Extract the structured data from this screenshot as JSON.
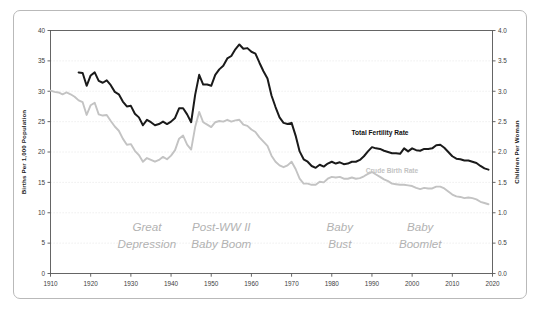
{
  "chart_data": {
    "type": "line",
    "title": "",
    "xlabel": "",
    "ylabel": "Births Per 1,000 Population",
    "y2label": "Children Per Woman",
    "xlim": [
      1910,
      2020
    ],
    "ylim": [
      0,
      40
    ],
    "y2lim": [
      0.0,
      4.0
    ],
    "grid": true,
    "legend_position": "inline-annotation",
    "x_ticks": [
      "1910",
      "1920",
      "1930",
      "1940",
      "1950",
      "1960",
      "1970",
      "1980",
      "1990",
      "2000",
      "2010",
      "2020"
    ],
    "y_ticks": [
      "0",
      "5",
      "10",
      "15",
      "20",
      "25",
      "30",
      "35",
      "40"
    ],
    "y2_ticks": [
      "0.0",
      "0.5",
      "1.0",
      "1.5",
      "2.0",
      "2.5",
      "3.0",
      "3.5",
      "4.0"
    ],
    "series": [
      {
        "name": "Total Fertility Rate",
        "axis": "right",
        "color": "#1a1a1a",
        "label_x": 1992,
        "label_y": 2.28,
        "x": [
          1917,
          1918,
          1919,
          1920,
          1921,
          1922,
          1923,
          1924,
          1925,
          1926,
          1927,
          1928,
          1929,
          1930,
          1931,
          1932,
          1933,
          1934,
          1935,
          1936,
          1937,
          1938,
          1939,
          1940,
          1941,
          1942,
          1943,
          1944,
          1945,
          1946,
          1947,
          1948,
          1949,
          1950,
          1951,
          1952,
          1953,
          1954,
          1955,
          1956,
          1957,
          1958,
          1959,
          1960,
          1961,
          1962,
          1963,
          1964,
          1965,
          1966,
          1967,
          1968,
          1969,
          1970,
          1971,
          1972,
          1973,
          1974,
          1975,
          1976,
          1977,
          1978,
          1979,
          1980,
          1981,
          1982,
          1983,
          1984,
          1985,
          1986,
          1987,
          1988,
          1989,
          1990,
          1991,
          1992,
          1993,
          1994,
          1995,
          1996,
          1997,
          1998,
          1999,
          2000,
          2001,
          2002,
          2003,
          2004,
          2005,
          2006,
          2007,
          2008,
          2009,
          2010,
          2011,
          2012,
          2013,
          2014,
          2015,
          2016,
          2017,
          2018,
          2019
        ],
        "y": [
          3.31,
          3.3,
          3.09,
          3.26,
          3.31,
          3.17,
          3.14,
          3.18,
          3.1,
          2.99,
          2.95,
          2.83,
          2.75,
          2.76,
          2.63,
          2.57,
          2.44,
          2.53,
          2.49,
          2.44,
          2.46,
          2.5,
          2.46,
          2.5,
          2.56,
          2.72,
          2.72,
          2.62,
          2.49,
          2.94,
          3.27,
          3.11,
          3.11,
          3.09,
          3.27,
          3.36,
          3.42,
          3.54,
          3.58,
          3.69,
          3.77,
          3.7,
          3.71,
          3.65,
          3.62,
          3.47,
          3.33,
          3.21,
          2.93,
          2.74,
          2.57,
          2.48,
          2.46,
          2.48,
          2.27,
          2.01,
          1.88,
          1.84,
          1.77,
          1.74,
          1.79,
          1.76,
          1.81,
          1.84,
          1.81,
          1.83,
          1.8,
          1.81,
          1.84,
          1.84,
          1.87,
          1.93,
          2.01,
          2.08,
          2.06,
          2.05,
          2.02,
          2.0,
          1.98,
          1.98,
          1.97,
          2.06,
          2.01,
          2.06,
          2.03,
          2.02,
          2.05,
          2.05,
          2.06,
          2.11,
          2.12,
          2.07,
          2.0,
          1.93,
          1.89,
          1.88,
          1.86,
          1.86,
          1.84,
          1.82,
          1.77,
          1.73,
          1.71
        ]
      },
      {
        "name": "Crude Birth Rate",
        "axis": "left",
        "color": "#c3c3c3",
        "label_x": 1995,
        "label_y": 16.6,
        "x": [
          1910,
          1911,
          1912,
          1913,
          1914,
          1915,
          1916,
          1917,
          1918,
          1919,
          1920,
          1921,
          1922,
          1923,
          1924,
          1925,
          1926,
          1927,
          1928,
          1929,
          1930,
          1931,
          1932,
          1933,
          1934,
          1935,
          1936,
          1937,
          1938,
          1939,
          1940,
          1941,
          1942,
          1943,
          1944,
          1945,
          1946,
          1947,
          1948,
          1949,
          1950,
          1951,
          1952,
          1953,
          1954,
          1955,
          1956,
          1957,
          1958,
          1959,
          1960,
          1961,
          1962,
          1963,
          1964,
          1965,
          1966,
          1967,
          1968,
          1969,
          1970,
          1971,
          1972,
          1973,
          1974,
          1975,
          1976,
          1977,
          1978,
          1979,
          1980,
          1981,
          1982,
          1983,
          1984,
          1985,
          1986,
          1987,
          1988,
          1989,
          1990,
          1991,
          1992,
          1993,
          1994,
          1995,
          1996,
          1997,
          1998,
          1999,
          2000,
          2001,
          2002,
          2003,
          2004,
          2005,
          2006,
          2007,
          2008,
          2009,
          2010,
          2011,
          2012,
          2013,
          2014,
          2015,
          2016,
          2017,
          2018,
          2019
        ],
        "y": [
          30.1,
          29.9,
          29.8,
          29.5,
          29.8,
          29.5,
          29.1,
          28.5,
          28.2,
          26.1,
          27.7,
          28.1,
          26.2,
          26.0,
          26.1,
          25.1,
          24.2,
          23.5,
          22.2,
          21.2,
          21.3,
          20.2,
          19.5,
          18.4,
          19.0,
          18.7,
          18.4,
          18.7,
          19.2,
          18.8,
          19.4,
          20.3,
          22.2,
          22.7,
          21.2,
          20.4,
          24.1,
          26.6,
          24.9,
          24.5,
          24.1,
          24.9,
          25.1,
          25.0,
          25.3,
          25.0,
          25.2,
          25.3,
          24.5,
          24.3,
          23.7,
          23.3,
          22.4,
          21.7,
          21.0,
          19.4,
          18.4,
          17.8,
          17.5,
          17.8,
          18.4,
          17.2,
          15.6,
          14.8,
          14.8,
          14.6,
          14.6,
          15.1,
          15.0,
          15.6,
          15.9,
          15.8,
          15.9,
          15.6,
          15.6,
          15.8,
          15.6,
          15.7,
          16.0,
          16.4,
          16.7,
          16.3,
          15.9,
          15.5,
          15.2,
          14.8,
          14.7,
          14.6,
          14.6,
          14.5,
          14.4,
          14.1,
          13.9,
          14.1,
          14.0,
          14.0,
          14.3,
          14.3,
          14.0,
          13.5,
          13.0,
          12.7,
          12.6,
          12.4,
          12.5,
          12.4,
          12.2,
          11.8,
          11.6,
          11.4
        ]
      }
    ],
    "annotations": [
      {
        "name": "great-depression",
        "lines": [
          "Great",
          "Depression"
        ],
        "x": 1934.0,
        "y_px": 231
      },
      {
        "name": "post-ww2-baby-boom",
        "lines": [
          "Post-WW II",
          "Baby Boom"
        ],
        "x": 1952.5,
        "y_px": 231
      },
      {
        "name": "baby-bust",
        "lines": [
          "Baby",
          "Bust"
        ],
        "x": 1982.0,
        "y_px": 231
      },
      {
        "name": "baby-boomlet",
        "lines": [
          "Baby",
          "Boomlet"
        ],
        "x": 2002.0,
        "y_px": 231
      }
    ],
    "colors": {
      "tfr_line": "#1a1a1a",
      "cbr_line": "#c3c3c3",
      "grid": "#e8e8e8",
      "axis": "#555555",
      "frame": "#b9b9b9",
      "annotation_text": "#b2b2b2"
    }
  }
}
